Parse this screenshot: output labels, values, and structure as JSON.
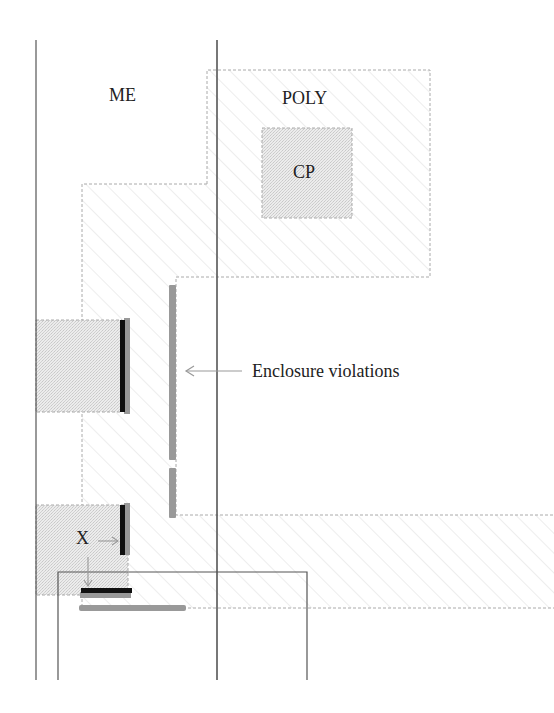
{
  "diagram": {
    "type": "layout-diagram",
    "labels": {
      "metal": "ME",
      "poly": "POLY",
      "contact_poly": "CP",
      "enclosure_violations": "Enclosure violations",
      "x_marker": "X"
    },
    "colors": {
      "line": "#555555",
      "dashed_outline": "#aaaaaa",
      "hatch": "#d8d8d8",
      "stipple_fill": "#e6e6e6",
      "violation_black": "#111111",
      "violation_gray": "#999999",
      "arrow": "#999999"
    }
  }
}
